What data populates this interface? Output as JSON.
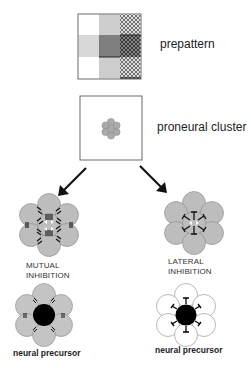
{
  "figure": {
    "stages": [
      {
        "id": "prepattern",
        "label": "prepattern"
      },
      {
        "id": "proneural",
        "label": "proneural cluster"
      }
    ],
    "branches": [
      {
        "id": "mutual",
        "label_line1": "MUTUAL",
        "label_line2": "INHIBITION",
        "result_label": "neural precursor"
      },
      {
        "id": "lateral",
        "label_line1": "LATERAL",
        "label_line2": "INHIBITION",
        "result_label": "neural precursor"
      }
    ],
    "colors": {
      "cell_gray": "#bdbdbd",
      "cell_outline": "#8a8a8a",
      "precursor": "#000000",
      "line": "#222222"
    }
  }
}
